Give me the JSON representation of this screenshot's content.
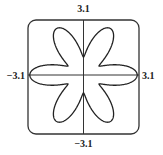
{
  "chart_data": {
    "type": "line",
    "subtype": "polar-rose",
    "title": "",
    "petals": 6,
    "petal_directions_deg": [
      0,
      60,
      120,
      180,
      240,
      300
    ],
    "r_max": 3.0,
    "r_min": 1.0,
    "equation_estimate": "r = 1 + 2|cos(3θ)|",
    "xlim": [
      -3.1,
      3.1
    ],
    "ylim": [
      -3.1,
      3.1
    ],
    "tick_labels": {
      "top": "3.1",
      "bottom": "−3.1",
      "left": "−3.1",
      "right": "3.1"
    },
    "axes_through_origin": true,
    "grid": false,
    "frame": "rounded-square",
    "curve_color": "#222222",
    "axis_color": "#333333"
  }
}
